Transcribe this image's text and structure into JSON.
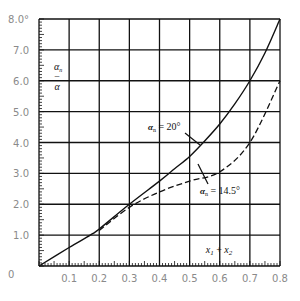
{
  "chart_data": {
    "type": "line",
    "title": "",
    "xlabel": "x1 + x2",
    "ylabel": "α − αn",
    "xlim": [
      0,
      0.8
    ],
    "ylim": [
      0,
      8.0
    ],
    "grid": true,
    "x_ticks": [
      "0",
      "0.1",
      "0.2",
      "0.3",
      "0.4",
      "0.5",
      "0.6",
      "0.7",
      "0.8"
    ],
    "y_ticks": [
      "0",
      "1.0",
      "2.0",
      "3.0",
      "4.0",
      "5.0",
      "6.0",
      "7.0",
      "8.0°"
    ],
    "series": [
      {
        "name": "αn = 20°",
        "style": "solid",
        "x": [
          0,
          0.1,
          0.17,
          0.2,
          0.3,
          0.4,
          0.45,
          0.5,
          0.55,
          0.6,
          0.65,
          0.7,
          0.75,
          0.8
        ],
        "values": [
          0,
          0.6,
          1.0,
          1.2,
          2.0,
          2.75,
          3.15,
          3.55,
          4.05,
          4.6,
          5.25,
          6.0,
          6.9,
          8.0
        ]
      },
      {
        "name": "αn = 14.5°",
        "style": "dashed",
        "x": [
          0.2,
          0.3,
          0.4,
          0.5,
          0.6,
          0.7,
          0.8
        ],
        "values": [
          1.15,
          1.9,
          2.4,
          2.75,
          3.05,
          4.0,
          6.0
        ]
      }
    ],
    "annotations": [
      {
        "text": "αn = 20°",
        "series": "αn = 20°"
      },
      {
        "text": "αn = 14.5°",
        "series": "αn = 14.5°"
      }
    ]
  },
  "labels": {
    "ylabel_top": "α",
    "ylabel_mid": "−",
    "ylabel_bot": "α",
    "ylabel_sub": "n",
    "xlabel_x1": "x",
    "xlabel_sub1": "1",
    "xlabel_plus": " + ",
    "xlabel_x2": "x",
    "xlabel_sub2": "2",
    "anno20_alpha": "α",
    "anno20_sub": "n",
    "anno20_val": " = 20°",
    "anno145_alpha": "α",
    "anno145_sub": "n",
    "anno145_val": " = 14.5°"
  }
}
